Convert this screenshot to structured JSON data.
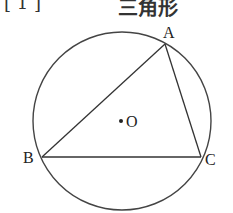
{
  "header": {
    "problem_number": "[ 1 ]",
    "title": "三角形"
  },
  "diagram": {
    "type": "triangle-inscribed-in-circle",
    "circle": {
      "cx": 122,
      "cy": 121,
      "r": 89,
      "stroke": "#444444"
    },
    "center": {
      "label": "O",
      "x": 121,
      "y": 121
    },
    "vertices": [
      {
        "label": "A",
        "x": 165,
        "y": 44
      },
      {
        "label": "B",
        "x": 42,
        "y": 157
      },
      {
        "label": "C",
        "x": 201,
        "y": 157
      }
    ],
    "edges": [
      [
        "A",
        "B"
      ],
      [
        "B",
        "C"
      ],
      [
        "C",
        "A"
      ]
    ]
  }
}
